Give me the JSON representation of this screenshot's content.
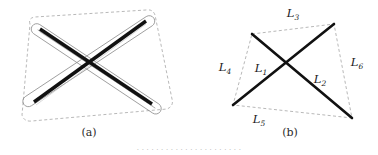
{
  "figure": {
    "panels": [
      {
        "id": "a",
        "caption": "(a)",
        "description": "Two thick crossing bars with rounded capsule outlines inside a dashed quadrilateral boundary"
      },
      {
        "id": "b",
        "caption": "(b)",
        "description": "Two crossing diagonals inside a dashed quadrilateral with labelled segments"
      }
    ],
    "labels": {
      "L1": {
        "base": "L",
        "sub": "1"
      },
      "L2": {
        "base": "L",
        "sub": "2"
      },
      "L3": {
        "base": "L",
        "sub": "3"
      },
      "L4": {
        "base": "L",
        "sub": "4"
      },
      "L5": {
        "base": "L",
        "sub": "5"
      },
      "L6": {
        "base": "L",
        "sub": "6"
      }
    },
    "bottom_caption_fragment": "· · ·   · · ·   · · · · · ·   · ·   · · ·   · · · · ·",
    "colors": {
      "background": "#ffffff",
      "bar_fill": "#111111",
      "outline": "#8c8c8c",
      "dashed_boundary": "#9a9a9a",
      "label_text": "#1a1a1a"
    }
  }
}
